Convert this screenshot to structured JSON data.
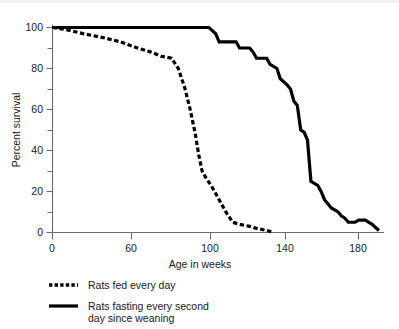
{
  "chart_data": {
    "type": "line",
    "title": "",
    "xlabel": "Age in weeks",
    "ylabel": "Percent survival",
    "xlim": [
      0,
      196
    ],
    "ylim": [
      0,
      104
    ],
    "xticks": [
      0,
      60,
      100,
      140,
      180
    ],
    "xticklabels": [
      "0",
      "60",
      "100",
      "140",
      "180"
    ],
    "yticks": [
      0,
      20,
      40,
      60,
      80,
      100
    ],
    "yticklabels": [
      "0",
      "20",
      "40",
      "60",
      "80",
      "100"
    ],
    "yminorticks": [
      10,
      30,
      50,
      70,
      90
    ],
    "grid": false,
    "legend_position": "below-axes-left",
    "series": [
      {
        "name": "Rats fed every day",
        "style": "dashed",
        "color": "#000000",
        "points": [
          [
            0,
            100
          ],
          [
            8,
            99
          ],
          [
            18,
            97
          ],
          [
            30,
            95
          ],
          [
            40,
            93
          ],
          [
            50,
            90
          ],
          [
            58,
            88
          ],
          [
            64,
            86
          ],
          [
            70,
            85
          ],
          [
            74,
            80
          ],
          [
            78,
            70
          ],
          [
            81,
            60
          ],
          [
            84,
            48
          ],
          [
            86,
            38
          ],
          [
            88,
            30
          ],
          [
            90,
            27
          ],
          [
            94,
            22
          ],
          [
            98,
            16
          ],
          [
            102,
            10
          ],
          [
            106,
            5
          ],
          [
            110,
            4
          ],
          [
            116,
            3
          ],
          [
            120,
            2
          ],
          [
            126,
            1
          ],
          [
            130,
            0
          ]
        ]
      },
      {
        "name": "Rats fasting every second day since weaning",
        "style": "solid",
        "color": "#000000",
        "points": [
          [
            0,
            100
          ],
          [
            92,
            100
          ],
          [
            96,
            97
          ],
          [
            98,
            93
          ],
          [
            108,
            93
          ],
          [
            110,
            90
          ],
          [
            116,
            90
          ],
          [
            118,
            88
          ],
          [
            120,
            85
          ],
          [
            126,
            85
          ],
          [
            128,
            82
          ],
          [
            132,
            80
          ],
          [
            134,
            75
          ],
          [
            138,
            72
          ],
          [
            140,
            70
          ],
          [
            142,
            64
          ],
          [
            144,
            62
          ],
          [
            146,
            50
          ],
          [
            148,
            49
          ],
          [
            150,
            45
          ],
          [
            152,
            25
          ],
          [
            156,
            23
          ],
          [
            158,
            20
          ],
          [
            160,
            16
          ],
          [
            162,
            14
          ],
          [
            164,
            12
          ],
          [
            168,
            10
          ],
          [
            170,
            8
          ],
          [
            172,
            7
          ],
          [
            174,
            5
          ],
          [
            178,
            5
          ],
          [
            180,
            6
          ],
          [
            184,
            6
          ],
          [
            188,
            4
          ],
          [
            192,
            1
          ]
        ]
      }
    ],
    "annotations": []
  },
  "legend": {
    "items": [
      {
        "label": "Rats fed every day",
        "style": "dashed"
      },
      {
        "label": "Rats fasting every second",
        "label2": "day since weaning",
        "style": "solid"
      }
    ]
  }
}
